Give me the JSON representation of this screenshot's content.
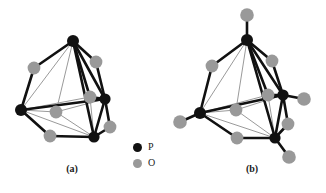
{
  "figure": {
    "title": "",
    "subfigures": [
      {
        "id": "a",
        "label": "(a)"
      },
      {
        "id": "b",
        "label": "(b)"
      }
    ]
  },
  "legend": {
    "items": [
      {
        "symbol": "P",
        "label": "P",
        "color": "#111111",
        "icon": "filled-circle-icon"
      },
      {
        "symbol": "O",
        "label": "O",
        "color": "#999999",
        "icon": "filled-circle-icon"
      }
    ]
  },
  "colors": {
    "phosphorus": "#111111",
    "oxygen": "#999999",
    "bond_dark": "#111111",
    "bond_light": "#9a9a9a",
    "background": "#ffffff"
  },
  "chart_data": {
    "type": "diagram",
    "title": "",
    "subtitle": "",
    "xlabel": "",
    "ylabel": "",
    "structures": [
      {
        "id": "a",
        "label": "(a)",
        "atom_counts": {
          "P": 4,
          "O": 6
        },
        "atoms": [
          {
            "id": "a-P1",
            "element": "P",
            "x": 73,
            "y": 41,
            "r": 6.0
          },
          {
            "id": "a-P2",
            "element": "P",
            "x": 21,
            "y": 110,
            "r": 6.0
          },
          {
            "id": "a-P3",
            "element": "P",
            "x": 105,
            "y": 99,
            "r": 5.6
          },
          {
            "id": "a-P4",
            "element": "P",
            "x": 94,
            "y": 137,
            "r": 5.6
          },
          {
            "id": "a-O1",
            "element": "O",
            "x": 34,
            "y": 68,
            "r": 6.4
          },
          {
            "id": "a-O2",
            "element": "O",
            "x": 96,
            "y": 62,
            "r": 6.4
          },
          {
            "id": "a-O3",
            "element": "O",
            "x": 90,
            "y": 97,
            "r": 6.4
          },
          {
            "id": "a-O4",
            "element": "O",
            "x": 50,
            "y": 136,
            "r": 6.4
          },
          {
            "id": "a-O5",
            "element": "O",
            "x": 110,
            "y": 127,
            "r": 6.4
          },
          {
            "id": "a-O6",
            "element": "O",
            "x": 56,
            "y": 112,
            "r": 6.4
          }
        ],
        "bonds": [
          {
            "from": "a-P1",
            "to": "a-O1",
            "style": "dark"
          },
          {
            "from": "a-O1",
            "to": "a-P2",
            "style": "dark"
          },
          {
            "from": "a-P1",
            "to": "a-O2",
            "style": "dark"
          },
          {
            "from": "a-O2",
            "to": "a-P3",
            "style": "dark"
          },
          {
            "from": "a-P1",
            "to": "a-O3",
            "style": "dark"
          },
          {
            "from": "a-O3",
            "to": "a-P3",
            "style": "dark"
          },
          {
            "from": "a-P1",
            "to": "a-O6",
            "style": "light"
          },
          {
            "from": "a-O6",
            "to": "a-P2",
            "style": "light"
          },
          {
            "from": "a-P2",
            "to": "a-O4",
            "style": "dark"
          },
          {
            "from": "a-O4",
            "to": "a-P4",
            "style": "dark"
          },
          {
            "from": "a-P3",
            "to": "a-O5",
            "style": "dark"
          },
          {
            "from": "a-O5",
            "to": "a-P4",
            "style": "dark"
          },
          {
            "from": "a-P1",
            "to": "a-P4",
            "style": "dark"
          },
          {
            "from": "a-P1",
            "to": "a-P3",
            "style": "dark"
          },
          {
            "from": "a-P1",
            "to": "a-P2",
            "style": "light"
          },
          {
            "from": "a-P2",
            "to": "a-P3",
            "style": "dark"
          },
          {
            "from": "a-P2",
            "to": "a-P4",
            "style": "light"
          },
          {
            "from": "a-P3",
            "to": "a-P4",
            "style": "dark"
          },
          {
            "from": "a-P2",
            "to": "a-O3",
            "style": "light"
          },
          {
            "from": "a-P4",
            "to": "a-O3",
            "style": "light"
          },
          {
            "from": "a-P4",
            "to": "a-O6",
            "style": "light"
          },
          {
            "from": "a-P3",
            "to": "a-O6",
            "style": "light"
          }
        ]
      },
      {
        "id": "b",
        "label": "(b)",
        "atom_counts": {
          "P": 4,
          "O": 10
        },
        "atoms": [
          {
            "id": "b-P1",
            "element": "P",
            "x": 247,
            "y": 40,
            "r": 6.0
          },
          {
            "id": "b-P2",
            "element": "P",
            "x": 200,
            "y": 113,
            "r": 6.0
          },
          {
            "id": "b-P3",
            "element": "P",
            "x": 283,
            "y": 95,
            "r": 5.6
          },
          {
            "id": "b-P4",
            "element": "P",
            "x": 275,
            "y": 138,
            "r": 5.6
          },
          {
            "id": "b-O1",
            "element": "O",
            "x": 212,
            "y": 66,
            "r": 6.4
          },
          {
            "id": "b-O2",
            "element": "O",
            "x": 272,
            "y": 61,
            "r": 6.4
          },
          {
            "id": "b-O3",
            "element": "O",
            "x": 268,
            "y": 95,
            "r": 6.4
          },
          {
            "id": "b-O4",
            "element": "O",
            "x": 237,
            "y": 138,
            "r": 6.4
          },
          {
            "id": "b-O5",
            "element": "O",
            "x": 288,
            "y": 124,
            "r": 6.4
          },
          {
            "id": "b-O6",
            "element": "O",
            "x": 236,
            "y": 110,
            "r": 6.4
          },
          {
            "id": "b-Ot1",
            "element": "O",
            "x": 247,
            "y": 15,
            "r": 6.8,
            "terminal": true
          },
          {
            "id": "b-Ot2",
            "element": "O",
            "x": 180,
            "y": 122,
            "r": 6.8,
            "terminal": true
          },
          {
            "id": "b-Ot3",
            "element": "O",
            "x": 304,
            "y": 99,
            "r": 6.8,
            "terminal": true
          },
          {
            "id": "b-Ot4",
            "element": "O",
            "x": 289,
            "y": 157,
            "r": 6.8,
            "terminal": true
          }
        ],
        "bonds": [
          {
            "from": "b-P1",
            "to": "b-Ot1",
            "style": "dark"
          },
          {
            "from": "b-P2",
            "to": "b-Ot2",
            "style": "dark"
          },
          {
            "from": "b-P3",
            "to": "b-Ot3",
            "style": "dark"
          },
          {
            "from": "b-P4",
            "to": "b-Ot4",
            "style": "dark"
          },
          {
            "from": "b-P1",
            "to": "b-O1",
            "style": "dark"
          },
          {
            "from": "b-O1",
            "to": "b-P2",
            "style": "dark"
          },
          {
            "from": "b-P1",
            "to": "b-O2",
            "style": "dark"
          },
          {
            "from": "b-O2",
            "to": "b-P3",
            "style": "dark"
          },
          {
            "from": "b-P1",
            "to": "b-O3",
            "style": "dark"
          },
          {
            "from": "b-O3",
            "to": "b-P3",
            "style": "dark"
          },
          {
            "from": "b-P1",
            "to": "b-O6",
            "style": "light"
          },
          {
            "from": "b-O6",
            "to": "b-P2",
            "style": "light"
          },
          {
            "from": "b-P2",
            "to": "b-O4",
            "style": "dark"
          },
          {
            "from": "b-O4",
            "to": "b-P4",
            "style": "dark"
          },
          {
            "from": "b-P3",
            "to": "b-O5",
            "style": "dark"
          },
          {
            "from": "b-O5",
            "to": "b-P4",
            "style": "dark"
          },
          {
            "from": "b-P1",
            "to": "b-P2",
            "style": "light"
          },
          {
            "from": "b-P1",
            "to": "b-P3",
            "style": "dark"
          },
          {
            "from": "b-P1",
            "to": "b-P4",
            "style": "dark"
          },
          {
            "from": "b-P2",
            "to": "b-P3",
            "style": "dark"
          },
          {
            "from": "b-P2",
            "to": "b-P4",
            "style": "light"
          },
          {
            "from": "b-P3",
            "to": "b-P4",
            "style": "dark"
          },
          {
            "from": "b-P2",
            "to": "b-O3",
            "style": "light"
          },
          {
            "from": "b-P4",
            "to": "b-O3",
            "style": "light"
          },
          {
            "from": "b-P4",
            "to": "b-O6",
            "style": "light"
          },
          {
            "from": "b-P3",
            "to": "b-O6",
            "style": "light"
          }
        ]
      }
    ]
  }
}
